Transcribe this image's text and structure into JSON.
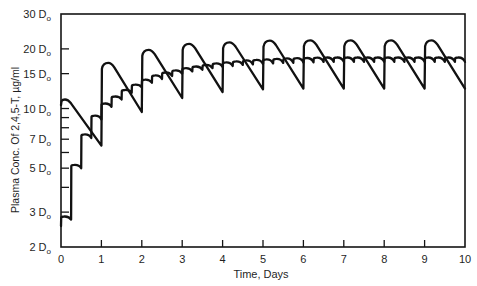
{
  "figure": {
    "background": "#ffffff",
    "ink": "#111111"
  },
  "chart_data": {
    "type": "line",
    "title": "",
    "xlabel": "Time, Days",
    "ylabel": "Plasma Conc. Of 2,4,5-T, µg/ml",
    "xlim": [
      0,
      10
    ],
    "ylim": [
      2,
      30
    ],
    "y_scale": "log",
    "grid": false,
    "legend": null,
    "x_ticks": [
      0,
      1,
      2,
      3,
      4,
      5,
      6,
      7,
      8,
      9,
      10
    ],
    "x_tick_labels": [
      "0",
      "1",
      "2",
      "3",
      "4",
      "5",
      "6",
      "7",
      "8",
      "9",
      "10"
    ],
    "y_tick_labels": [
      {
        "value": 2,
        "text": "2 D",
        "sub": "o"
      },
      {
        "value": 3,
        "text": "3 D",
        "sub": "o"
      },
      {
        "value": 5,
        "text": "5 D",
        "sub": "o"
      },
      {
        "value": 7,
        "text": "7 D",
        "sub": "o"
      },
      {
        "value": 10,
        "text": "10 D",
        "sub": "o"
      },
      {
        "value": 15,
        "text": "15 D",
        "sub": "o"
      },
      {
        "value": 20,
        "text": "20 D",
        "sub": "o"
      },
      {
        "value": 30,
        "text": "30 D",
        "sub": "o"
      }
    ],
    "y_minor_ticks": [
      3,
      4,
      5,
      6,
      7,
      8,
      9,
      10,
      15,
      20
    ],
    "series": [
      {
        "name": "Curve A",
        "x": [
          0,
          0.1,
          1.0,
          1.17,
          2.0,
          2.17,
          3.0,
          3.17,
          4.0,
          4.17,
          5.0,
          5.17,
          6.0,
          6.17,
          7.0,
          7.17,
          8.0,
          8.17,
          9.0,
          9.17,
          10.0
        ],
        "y": [
          10.4,
          11.1,
          6.5,
          17.0,
          9.6,
          19.8,
          11.3,
          21.2,
          12.1,
          21.6,
          12.5,
          22.0,
          12.6,
          22.1,
          12.6,
          22.1,
          12.6,
          22.1,
          12.6,
          22.1,
          12.6
        ]
      },
      {
        "name": "Curve B",
        "x": [
          0,
          0.08,
          0.25,
          0.33,
          0.5,
          0.58,
          0.75,
          0.83,
          1.0,
          1.08,
          1.25,
          1.33,
          1.5,
          1.58,
          1.75,
          1.83,
          2.0,
          2.08,
          2.25,
          2.33,
          2.5,
          2.58,
          2.75,
          2.83,
          3.0,
          3.08,
          3.25,
          3.33,
          3.5,
          3.58,
          3.75,
          3.83,
          4.0,
          4.08,
          4.25,
          4.33,
          4.5,
          4.58,
          4.75,
          4.83,
          5.0,
          5.08,
          5.25,
          5.33,
          5.5,
          5.58,
          5.75,
          5.83,
          6.0,
          6.08,
          6.25,
          6.33,
          6.5,
          6.58,
          6.75,
          6.83,
          7.0,
          7.08,
          7.25,
          7.33,
          7.5,
          7.58,
          7.75,
          7.83,
          8.0,
          8.08,
          8.25,
          8.33,
          8.5,
          8.58,
          8.75,
          8.83,
          9.0,
          9.08,
          9.25,
          9.33,
          9.5,
          9.58,
          9.75,
          9.83,
          10.0
        ],
        "y": [
          2.55,
          2.85,
          2.75,
          5.2,
          5.0,
          7.4,
          7.1,
          9.2,
          8.8,
          10.6,
          10.2,
          11.5,
          11.1,
          12.4,
          12.0,
          13.2,
          12.8,
          14.0,
          13.5,
          14.7,
          14.1,
          15.2,
          14.6,
          15.6,
          15.0,
          16.0,
          15.4,
          16.3,
          15.7,
          16.6,
          16.0,
          16.9,
          16.2,
          17.1,
          16.4,
          17.3,
          16.6,
          17.5,
          16.7,
          17.6,
          16.8,
          17.7,
          16.9,
          17.8,
          17.0,
          17.9,
          17.0,
          17.95,
          17.1,
          18.0,
          17.1,
          18.05,
          17.2,
          18.1,
          17.2,
          18.1,
          17.2,
          18.1,
          17.2,
          18.1,
          17.2,
          18.1,
          17.2,
          18.1,
          17.2,
          18.1,
          17.2,
          18.1,
          17.2,
          18.1,
          17.2,
          18.1,
          17.2,
          18.1,
          17.2,
          18.1,
          17.2,
          18.1,
          17.2,
          18.1,
          17.2
        ]
      }
    ]
  }
}
